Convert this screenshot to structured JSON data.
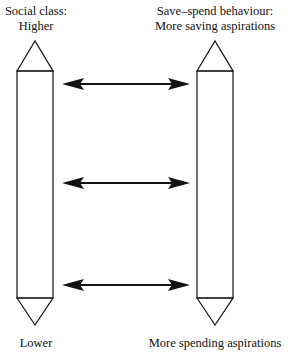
{
  "left_axis": {
    "title": "Social class:",
    "top_label": "Higher",
    "bottom_label": "Lower"
  },
  "right_axis": {
    "title": "Save–spend behaviour:",
    "top_label": "More saving aspirations",
    "bottom_label": "More spending aspirations"
  },
  "arrows": [
    {
      "name": "top",
      "y": 84
    },
    {
      "name": "middle",
      "y": 183
    },
    {
      "name": "bottom",
      "y": 285
    }
  ],
  "colors": {
    "line": "#111111",
    "background": "#ffffff"
  }
}
